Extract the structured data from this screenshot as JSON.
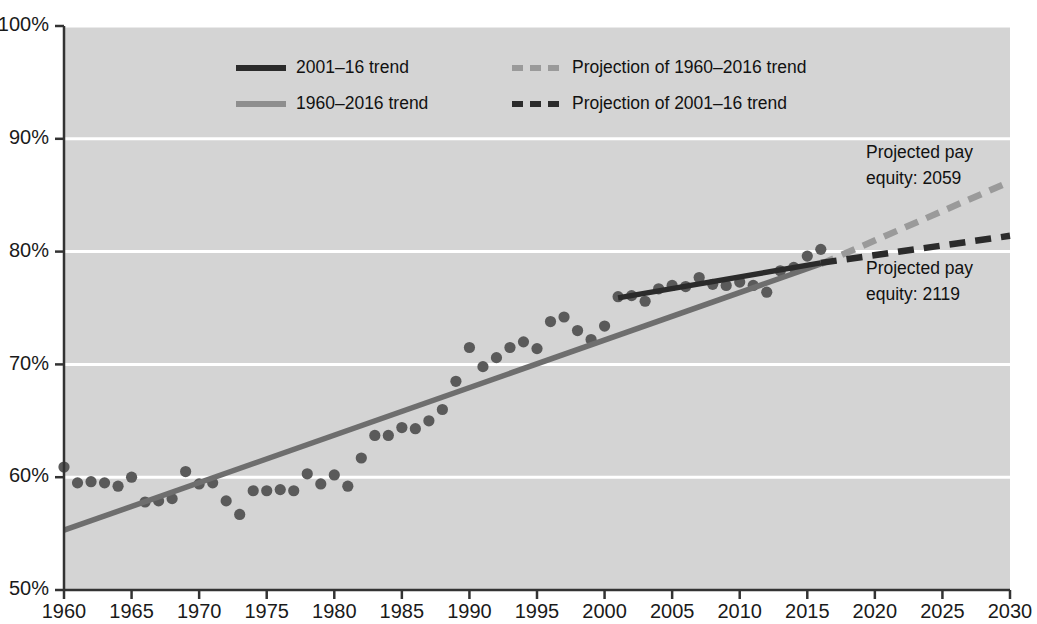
{
  "chart_data": {
    "type": "scatter",
    "title": "",
    "subtitle": "",
    "xlabel": "",
    "ylabel": "",
    "xlim": [
      1960,
      2030
    ],
    "ylim": [
      50,
      100
    ],
    "grid": true,
    "y_tick_labels": [
      "50%",
      "60%",
      "70%",
      "80%",
      "90%",
      "100%"
    ],
    "y_ticks": [
      50,
      60,
      70,
      80,
      90,
      100
    ],
    "x_tick_labels": [
      "1960",
      "1965",
      "1970",
      "1975",
      "1980",
      "1985",
      "1990",
      "1995",
      "2000",
      "2005",
      "2010",
      "2015",
      "2020",
      "2025",
      "2030"
    ],
    "x_ticks": [
      1960,
      1965,
      1970,
      1975,
      1980,
      1985,
      1990,
      1995,
      2000,
      2005,
      2010,
      2015,
      2020,
      2025,
      2030
    ],
    "legend_position": "top-center",
    "series": [
      {
        "name": "observed-ratio-points",
        "type": "scatter",
        "marker": "circle",
        "color": "#5a5a5a",
        "x": [
          1960,
          1961,
          1962,
          1963,
          1964,
          1965,
          1966,
          1967,
          1968,
          1969,
          1970,
          1971,
          1972,
          1973,
          1974,
          1975,
          1976,
          1977,
          1978,
          1979,
          1980,
          1981,
          1982,
          1983,
          1984,
          1985,
          1986,
          1987,
          1988,
          1989,
          1990,
          1991,
          1992,
          1993,
          1994,
          1995,
          1996,
          1997,
          1998,
          1999,
          2000,
          2001,
          2002,
          2003,
          2004,
          2005,
          2006,
          2007,
          2008,
          2009,
          2010,
          2011,
          2012,
          2013,
          2014,
          2015,
          2016
        ],
        "values": [
          60.9,
          59.5,
          59.6,
          59.5,
          59.2,
          60.0,
          57.8,
          57.9,
          58.1,
          60.5,
          59.4,
          59.5,
          57.9,
          56.7,
          58.8,
          58.8,
          58.9,
          58.8,
          60.3,
          59.4,
          60.2,
          59.2,
          61.7,
          63.7,
          63.7,
          64.4,
          64.3,
          65.0,
          66.0,
          68.5,
          71.5,
          69.8,
          70.6,
          71.5,
          72.0,
          71.4,
          73.8,
          74.2,
          73.0,
          72.2,
          73.4,
          76.0,
          76.1,
          75.6,
          76.7,
          77.0,
          76.9,
          77.7,
          77.1,
          77.0,
          77.3,
          77.0,
          76.4,
          78.3,
          78.6,
          79.6,
          80.2
        ]
      },
      {
        "name": "1960-2016 trend",
        "type": "line",
        "style": "solid",
        "color": "#6e6e6e",
        "x": [
          1960,
          2016
        ],
        "values": [
          55.3,
          78.9
        ]
      },
      {
        "name": "2001-16 trend",
        "type": "line",
        "style": "solid",
        "color": "#2b2b2b",
        "x": [
          2001,
          2016
        ],
        "values": [
          75.9,
          79.0
        ]
      },
      {
        "name": "Projection of 1960-2016 trend",
        "type": "line",
        "style": "dashed",
        "color": "#9a9a9a",
        "x": [
          2016,
          2030
        ],
        "values": [
          78.9,
          86.2
        ]
      },
      {
        "name": "Projection of 2001-16 trend",
        "type": "line",
        "style": "dashed",
        "color": "#2b2b2b",
        "x": [
          2016,
          2030
        ],
        "values": [
          79.0,
          81.4
        ]
      }
    ],
    "legend": [
      {
        "label": "2001–16 trend",
        "color": "#2b2b2b",
        "style": "solid"
      },
      {
        "label": "1960–2016 trend",
        "color": "#8e8e8e",
        "style": "solid"
      },
      {
        "label": "Projection of 1960–2016 trend",
        "color": "#9a9a9a",
        "style": "dashed"
      },
      {
        "label": "Projection of 2001–16 trend",
        "color": "#2b2b2b",
        "style": "dashed"
      }
    ],
    "annotations": [
      {
        "name": "projection-1960-2016-annotation",
        "line1": "Projected pay",
        "line2": "equity: 2059"
      },
      {
        "name": "projection-2001-16-annotation",
        "line1": "Projected pay",
        "line2": "equity: 2119"
      }
    ],
    "colors": {
      "plot_background": "#d4d4d4",
      "gridline": "#ffffff",
      "axis": "#333333",
      "point": "#5a5a5a",
      "trend_long": "#6e6e6e",
      "trend_short": "#2b2b2b",
      "projection_long": "#9a9a9a",
      "projection_short": "#2b2b2b",
      "text": "#111111"
    }
  }
}
